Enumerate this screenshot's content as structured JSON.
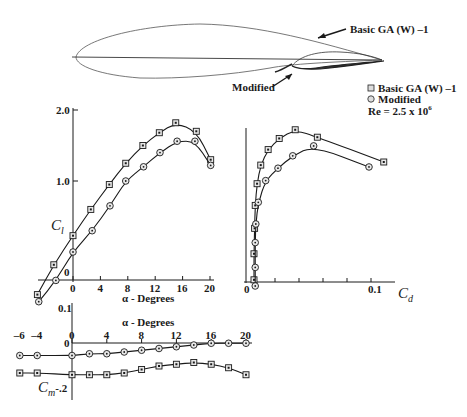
{
  "figure": {
    "airfoil": {
      "basic_label": "Basic GA (W) –1",
      "modified_label": "Modified"
    },
    "legend": {
      "basic": "Basic GA (W) –1",
      "modified": "Modified",
      "reynolds": "Re = 2.5 x 10",
      "reynolds_exp": "6"
    },
    "cl_chart": {
      "ylabel": "C",
      "ylabel_sub": "l",
      "xlabel": "α - Degrees",
      "yticks": [
        "2.0",
        "1.0",
        "0"
      ],
      "xticks": [
        "0",
        "4",
        "8",
        "12",
        "16",
        "20"
      ]
    },
    "cd_chart": {
      "xlabel": "C",
      "xlabel_sub": "d",
      "xticks": [
        "0",
        "0.1"
      ]
    },
    "cm_chart": {
      "ylabel": "C",
      "ylabel_sub": "m",
      "xlabel": "α - Degrees",
      "yticks": [
        "0.1",
        "0",
        "-.2"
      ],
      "xticks": [
        "–6",
        "–4",
        "0",
        "4",
        "8",
        "12",
        "16",
        "20"
      ]
    }
  },
  "colors": {
    "ink": "#1a1a1a",
    "background": "#ffffff",
    "marker_fill": "#e8e8e8"
  },
  "chart_data": [
    {
      "type": "line",
      "title": "Lift coefficient vs angle of attack",
      "xlabel": "α - Degrees",
      "ylabel": "C_l",
      "xlim": [
        -6,
        20
      ],
      "ylim": [
        -0.7,
        2.0
      ],
      "series": [
        {
          "name": "Basic GA (W) -1",
          "marker": "square",
          "x": [
            -5.2,
            -2.8,
            0,
            2.6,
            5.3,
            7.7,
            10.2,
            12.6,
            15.0,
            18.0,
            20.1
          ],
          "y": [
            -0.6,
            -0.18,
            0.23,
            0.6,
            0.95,
            1.25,
            1.5,
            1.68,
            1.82,
            1.7,
            1.3
          ]
        },
        {
          "name": "Modified",
          "marker": "circle",
          "x": [
            -5.0,
            -2.5,
            0,
            2.8,
            5.4,
            7.7,
            10.3,
            12.7,
            15.2,
            17.8,
            20.1
          ],
          "y": [
            -0.7,
            -0.4,
            0.0,
            0.3,
            0.65,
            1.0,
            1.2,
            1.4,
            1.56,
            1.56,
            1.22
          ]
        }
      ]
    },
    {
      "type": "line",
      "title": "Drag polar",
      "xlabel": "C_d",
      "ylabel": "C_l",
      "xlim": [
        0,
        0.14
      ],
      "series": [
        {
          "name": "Basic GA (W) -1",
          "marker": "square",
          "x": [
            0.0065,
            0.0065,
            0.007,
            0.0075,
            0.009,
            0.012,
            0.018,
            0.027,
            0.04,
            0.058,
            0.112
          ],
          "y": [
            -0.6,
            -0.18,
            0.23,
            0.6,
            0.95,
            1.25,
            1.5,
            1.68,
            1.82,
            1.7,
            1.3
          ]
        },
        {
          "name": "Modified",
          "marker": "circle",
          "x": [
            0.0075,
            0.0075,
            0.0075,
            0.008,
            0.01,
            0.016,
            0.026,
            0.038,
            0.055,
            0.1
          ],
          "y": [
            -0.7,
            -0.4,
            0.0,
            0.3,
            0.65,
            1.0,
            1.2,
            1.4,
            1.56,
            1.22
          ]
        }
      ]
    },
    {
      "type": "line",
      "title": "Pitching moment coefficient vs angle of attack",
      "xlabel": "α - Degrees",
      "ylabel": "C_m",
      "xlim": [
        -6,
        20
      ],
      "series": [
        {
          "name": "Modified",
          "marker": "circle",
          "x": [
            -6,
            -4,
            0,
            2,
            4,
            6,
            8,
            10,
            12,
            14,
            16,
            18,
            20
          ],
          "y": [
            -0.1,
            -0.1,
            -0.1,
            -0.09,
            -0.09,
            -0.08,
            -0.07,
            -0.06,
            -0.05,
            -0.04,
            -0.03,
            -0.03,
            -0.03
          ]
        },
        {
          "name": "Basic GA (W) -1",
          "marker": "square",
          "x": [
            -6,
            -4,
            0,
            2,
            4,
            6,
            8,
            10,
            12,
            14,
            16,
            18,
            20
          ],
          "y": [
            -0.2,
            -0.2,
            -0.21,
            -0.21,
            -0.21,
            -0.2,
            -0.18,
            -0.16,
            -0.15,
            -0.14,
            -0.15,
            -0.17,
            -0.21
          ]
        }
      ]
    }
  ]
}
